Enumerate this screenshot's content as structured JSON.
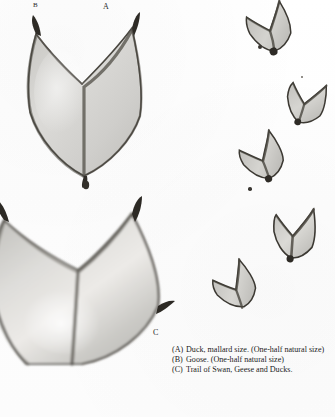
{
  "plate": {
    "kind": "photographic-plate",
    "subject": "Webbed bird footprints (duck, goose) and a trail",
    "background_color": "#fefefe",
    "ink_color": "#1c1c1c"
  },
  "figure_labels": [
    {
      "id": "A",
      "text": "A",
      "x": 103,
      "y": 3
    },
    {
      "id": "B",
      "text": "B",
      "x": 33,
      "y": 2
    },
    {
      "id": "C",
      "text": "C",
      "x": 153,
      "y": 330
    }
  ],
  "figures": [
    {
      "name": "duck-track-A",
      "label": "A",
      "kind": "webbed-footprint",
      "description": "Duck track, mallard size, one-half natural size",
      "x": 14,
      "y": 12,
      "w": 136,
      "h": 176,
      "fill": "#d6d5d2",
      "outline": "#3a3832"
    },
    {
      "name": "goose-track-B",
      "label": "B",
      "kind": "webbed-footprint",
      "description": "Goose track, one-half natural size",
      "x": -18,
      "y": 196,
      "w": 190,
      "h": 160,
      "fill": "#d2d1cd",
      "outline": "#3a3832"
    }
  ],
  "trail": {
    "name": "trail-C",
    "label": "C",
    "description": "Trail of Swan, Geese and Ducks",
    "prints": [
      {
        "index": 1,
        "x": 244,
        "y": 2,
        "w": 46,
        "h": 48,
        "rotate": -18,
        "fill": "#c9c8c4"
      },
      {
        "index": 2,
        "x": 283,
        "y": 78,
        "w": 42,
        "h": 44,
        "rotate": 14,
        "fill": "#cbcac6"
      },
      {
        "index": 3,
        "x": 238,
        "y": 133,
        "w": 44,
        "h": 46,
        "rotate": -24,
        "fill": "#c9c8c4"
      },
      {
        "index": 4,
        "x": 268,
        "y": 205,
        "w": 48,
        "h": 52,
        "rotate": 4,
        "fill": "#cfcecb"
      },
      {
        "index": 5,
        "x": 212,
        "y": 262,
        "w": 42,
        "h": 44,
        "rotate": -28,
        "fill": "#cbcac6"
      }
    ]
  },
  "caption": {
    "lines": [
      {
        "tag": "(A)",
        "text": "Duck, mallard size.  (One-half natural size)"
      },
      {
        "tag": "(B)",
        "text": "Goose.     (One-half natural size)"
      },
      {
        "tag": "(C)",
        "text": "Trail of Swan, Geese and Ducks."
      }
    ]
  }
}
